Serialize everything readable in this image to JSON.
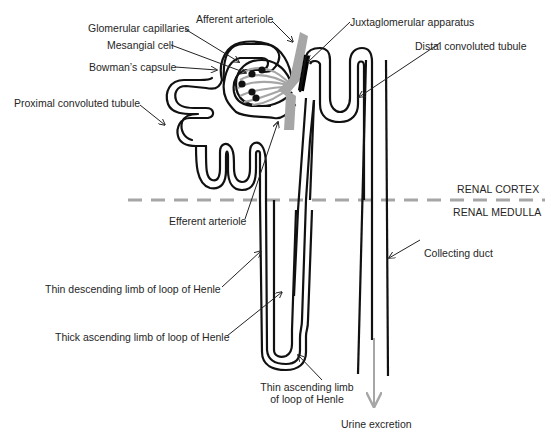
{
  "diagram": {
    "zones": {
      "cortex": "RENAL CORTEX",
      "medulla": "RENAL MEDULLA"
    },
    "labels": {
      "afferent_arteriole": "Afferent arteriole",
      "glomerular_capillaries": "Glomerular capillaries",
      "mesangial_cell": "Mesangial cell",
      "bowmans_capsule": "Bowman’s capsule",
      "proximal_convoluted_tubule": "Proximal convoluted tubule",
      "juxtaglomerular_apparatus": "Juxtaglomerular apparatus",
      "distal_convoluted_tubule": "Distal convoluted tubule",
      "efferent_arteriole": "Efferent arteriole",
      "collecting_duct": "Collecting duct",
      "thin_descending_limb": "Thin descending limb of loop of Henle",
      "thick_ascending_limb": "Thick ascending limb of loop of Henle",
      "thin_ascending_limb_line1": "Thin ascending limb",
      "thin_ascending_limb_line2": "of loop of Henle",
      "urine_excretion": "Urine excretion"
    },
    "colors": {
      "tubule": "#111111",
      "vessel": "#a6a6a6",
      "boundary": "#a6a6a6",
      "jga": "#000000",
      "text": "#262626"
    }
  }
}
